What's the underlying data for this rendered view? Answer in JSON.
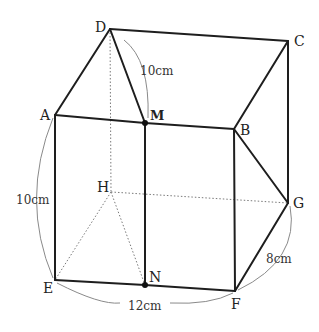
{
  "figure": {
    "vertices": {
      "A": {
        "label": "A",
        "x": 55,
        "y": 115
      },
      "B": {
        "label": "B",
        "x": 234,
        "y": 129
      },
      "C": {
        "label": "C",
        "x": 288,
        "y": 41
      },
      "D": {
        "label": "D",
        "x": 110,
        "y": 29
      },
      "E": {
        "label": "E",
        "x": 55,
        "y": 280
      },
      "F": {
        "label": "F",
        "x": 235,
        "y": 291
      },
      "G": {
        "label": "G",
        "x": 288,
        "y": 203
      },
      "H": {
        "label": "H",
        "x": 111,
        "y": 192
      },
      "M": {
        "label": "M",
        "x": 145,
        "y": 123
      },
      "N": {
        "label": "N",
        "x": 145,
        "y": 285
      }
    },
    "solid_edges": [
      [
        "D",
        "C"
      ],
      [
        "D",
        "A"
      ],
      [
        "D",
        "M"
      ],
      [
        "C",
        "B"
      ],
      [
        "C",
        "G"
      ],
      [
        "A",
        "M"
      ],
      [
        "M",
        "B"
      ],
      [
        "A",
        "E"
      ],
      [
        "M",
        "N"
      ],
      [
        "B",
        "F"
      ],
      [
        "B",
        "G"
      ],
      [
        "E",
        "N"
      ],
      [
        "N",
        "F"
      ],
      [
        "F",
        "G"
      ]
    ],
    "hidden_edges": [
      [
        "D",
        "H"
      ],
      [
        "H",
        "E"
      ],
      [
        "H",
        "N"
      ],
      [
        "H",
        "G"
      ]
    ],
    "marked_points": [
      "M",
      "N"
    ],
    "dimensions": {
      "DM": "10cm",
      "AE": "10cm",
      "EF": "12cm",
      "FG": "8cm"
    }
  }
}
